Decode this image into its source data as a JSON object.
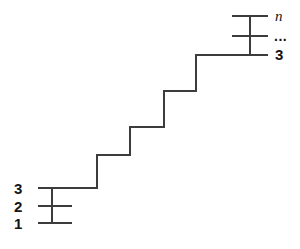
{
  "diagram": {
    "type": "staircase-hierarchy-diagram",
    "stroke_color": "#3c3c3c",
    "label_color": "#141414",
    "background_color": "#ffffff",
    "labels": {
      "bottom_left": [
        {
          "id": "bl-3",
          "text": "3"
        },
        {
          "id": "bl-2",
          "text": "2"
        },
        {
          "id": "bl-1",
          "text": "1"
        }
      ],
      "top_right": [
        {
          "id": "tr-n",
          "text": "n"
        },
        {
          "id": "tr-dots",
          "text": "..."
        },
        {
          "id": "tr-3",
          "text": "3"
        }
      ]
    },
    "geometry": {
      "canvas": {
        "width": 300,
        "height": 249
      },
      "stroke_width": 2,
      "bottom_left_group": {
        "tick_lines": [
          {
            "label": "3",
            "x1": 38,
            "x2": 97,
            "y": 188
          },
          {
            "label": "2",
            "x1": 38,
            "x2": 72,
            "y": 206
          },
          {
            "label": "1",
            "x1": 38,
            "x2": 72,
            "y": 223
          }
        ],
        "connector": {
          "x": 52,
          "y1": 188,
          "y2": 223
        }
      },
      "staircase_path": "M 38 188 L 97 188 L 97 155 L 130 155 L 130 127 L 164 127 L 164 91 L 196 91 L 196 55 L 268 55",
      "top_right_group": {
        "tick_lines": [
          {
            "label": "n",
            "x1": 232,
            "x2": 268,
            "y": 16
          },
          {
            "label": "...",
            "x1": 232,
            "x2": 268,
            "y": 36
          },
          {
            "label": "3",
            "x1": 196,
            "x2": 268,
            "y": 55
          }
        ],
        "connector": {
          "x": 250,
          "y1": 16,
          "y2": 55
        }
      }
    }
  }
}
